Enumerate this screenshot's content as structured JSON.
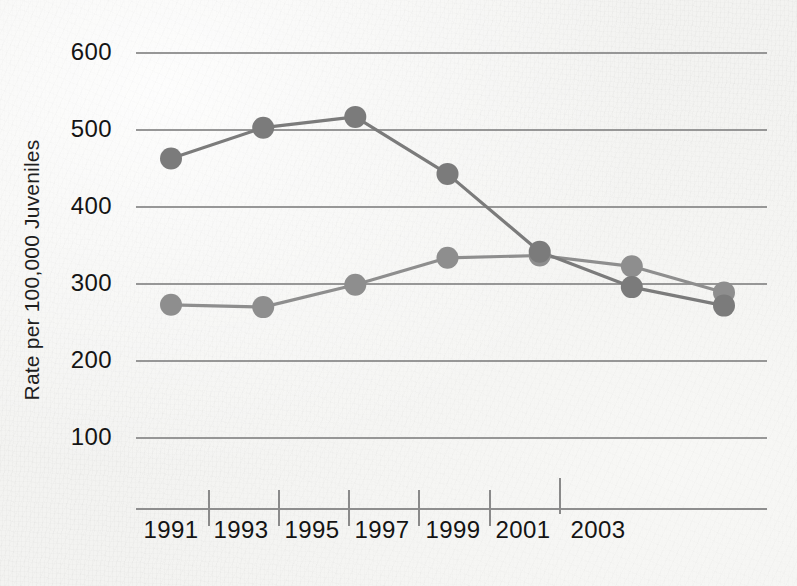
{
  "chart_data": {
    "type": "line",
    "title": "",
    "subtitle": "",
    "xlabel": "",
    "ylabel": "Rate per 100,000 Juveniles",
    "x": [
      1991,
      1992,
      1993,
      1994,
      1995,
      1996,
      1997,
      1998,
      1999,
      2000,
      2001,
      2002,
      2003
    ],
    "categories": [
      "1991",
      "1993",
      "1995",
      "1997",
      "1999",
      "2001",
      "2003"
    ],
    "xtick_labels": [
      "1991",
      "1993",
      "1995",
      "1997",
      "1999",
      "2001",
      "2003"
    ],
    "ytick_labels": [
      "600",
      "500",
      "400",
      "300",
      "200",
      "100"
    ],
    "ytick_values": [
      600,
      500,
      400,
      300,
      200,
      100
    ],
    "xlim": [
      1990,
      2004
    ],
    "ylim": [
      0,
      650
    ],
    "grid": true,
    "legend": "none",
    "marker": "circle",
    "series": [
      {
        "name": "series-upper",
        "color": "#7b7b7b",
        "x": [
          1991,
          1993,
          1995,
          1997,
          1999,
          2001,
          2003
        ],
        "values": [
          463,
          503,
          517,
          443,
          342,
          296,
          272
        ]
      },
      {
        "name": "series-lower",
        "color": "#8e8e8e",
        "x": [
          1991,
          1993,
          1995,
          1997,
          1999,
          2001,
          2003
        ],
        "values": [
          273,
          270,
          299,
          334,
          337,
          323,
          289
        ]
      }
    ]
  },
  "axes": {
    "y_title": "Rate per 100,000 Juveniles",
    "y_ticks": [
      "600",
      "500",
      "400",
      "300",
      "200",
      "100"
    ],
    "x_ticks": [
      "1991",
      "1993",
      "1995",
      "1997",
      "1999",
      "2001",
      "2003"
    ]
  },
  "colors": {
    "background": "#f3f3f1",
    "gridline": "#8e8e8e",
    "axis": "#8e8e8e",
    "text": "#141414",
    "series_upper": "#7b7b7b",
    "series_lower": "#8e8e8e"
  }
}
